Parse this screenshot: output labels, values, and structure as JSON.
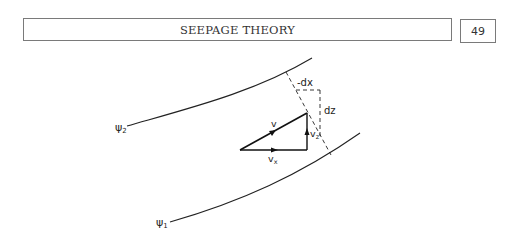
{
  "header": {
    "title": "SEEPAGE THEORY",
    "page_number": "49"
  },
  "figure": {
    "streamlines": [
      {
        "label": "ψ",
        "subscript": "2"
      },
      {
        "label": "ψ",
        "subscript": "1"
      }
    ],
    "vectors": {
      "v": "v",
      "vx": "v",
      "vx_sub": "x",
      "vz": "v",
      "vz_sub": "z"
    },
    "dimensions": {
      "dx": "-dx",
      "dz": "dz"
    }
  }
}
